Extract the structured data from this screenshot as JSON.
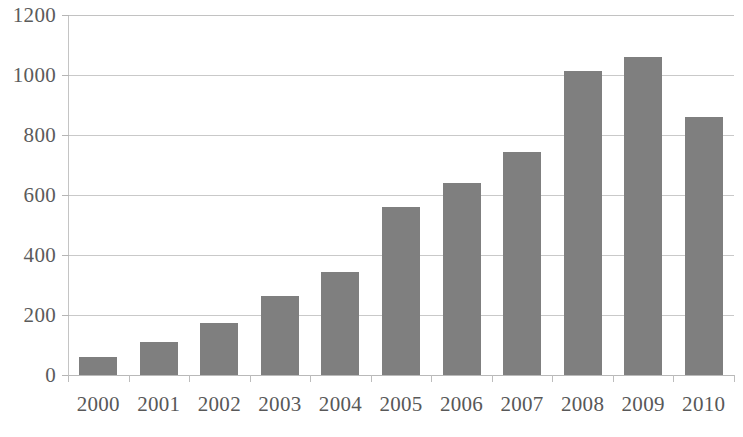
{
  "chart_data": {
    "type": "bar",
    "title": "",
    "subtitle": "",
    "xlabel": "",
    "ylabel": "",
    "categories": [
      "2000",
      "2001",
      "2002",
      "2003",
      "2004",
      "2005",
      "2006",
      "2007",
      "2008",
      "2009",
      "2010"
    ],
    "values": [
      60,
      110,
      175,
      265,
      345,
      560,
      640,
      745,
      1015,
      1060,
      860
    ],
    "series": [
      {
        "name": "Series 1",
        "values": [
          60,
          110,
          175,
          265,
          345,
          560,
          640,
          745,
          1015,
          1060,
          860
        ]
      }
    ],
    "ylim": [
      0,
      1200
    ],
    "y_ticks": [
      0,
      200,
      400,
      600,
      800,
      1000,
      1200
    ],
    "y_tick_labels": [
      "0",
      "200",
      "400",
      "600",
      "800",
      "1000",
      "1200"
    ],
    "grid": true,
    "grid_axis": "y",
    "legend": false,
    "legend_position": "none",
    "bar_color": "#7f7f7f",
    "gridline_color": "#c9c9c9",
    "axis_color": "#c4c4c4",
    "tick_label_color": "#585858",
    "background_color": "#ffffff"
  }
}
